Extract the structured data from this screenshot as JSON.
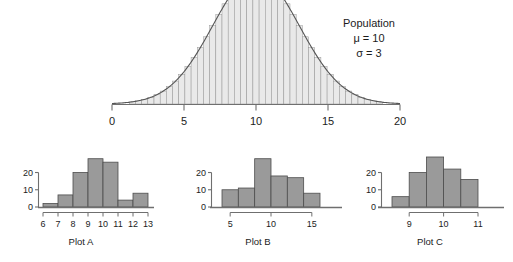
{
  "figure": {
    "background_color": "#ffffff",
    "bar_fill_color": "#9a9a9a",
    "bar_edge_color": "#4d4d4d",
    "curve_fill_color": "#e9e9e9",
    "curve_line_color": "#555555",
    "axis_color": "#6f6f6f",
    "text_color": "#1c1c1c"
  },
  "annotation": {
    "title": "Population",
    "mu": "μ = 10",
    "sigma": "σ = 3"
  },
  "chart_data": [
    {
      "type": "area",
      "name": "population-normal-curve",
      "title": "Population",
      "distribution": "normal",
      "mu": 10,
      "sigma": 3,
      "xlabel": "",
      "ylabel": "",
      "xlim": [
        0,
        20
      ],
      "xticks": [
        0,
        5,
        10,
        15,
        20
      ],
      "xticklabels": [
        "0",
        "5",
        "10",
        "15",
        "20"
      ],
      "grid": false,
      "legend": "none",
      "annotations": [
        "Population",
        "μ = 10",
        "σ = 3"
      ],
      "vertical_strips": true,
      "strip_count": 41,
      "x": [
        0,
        0.5,
        1,
        1.5,
        2,
        2.5,
        3,
        3.5,
        4,
        4.5,
        5,
        5.5,
        6,
        6.5,
        7,
        7.5,
        8,
        8.5,
        9,
        9.5,
        10,
        10.5,
        11,
        11.5,
        12,
        12.5,
        13,
        13.5,
        14,
        14.5,
        15,
        15.5,
        16,
        16.5,
        17,
        17.5,
        18,
        18.5,
        19,
        19.5,
        20
      ],
      "y": [
        0.0005,
        0.0009,
        0.0015,
        0.0024,
        0.0037,
        0.0055,
        0.0081,
        0.0116,
        0.0161,
        0.0218,
        0.0287,
        0.0368,
        0.0458,
        0.0555,
        0.0652,
        0.0743,
        0.0822,
        0.088,
        0.0913,
        0.0925,
        0.0913,
        0.088,
        0.0822,
        0.0743,
        0.0652,
        0.0555,
        0.0458,
        0.0368,
        0.0287,
        0.0218,
        0.0161,
        0.0116,
        0.0081,
        0.0055,
        0.0037,
        0.0024,
        0.0015,
        0.0009,
        0.0005,
        0.0003,
        0.0002
      ]
    },
    {
      "type": "bar",
      "name": "plot-a-histogram",
      "title": "Plot A",
      "xlabel": "Plot A",
      "ylabel": "",
      "bin_width": 1,
      "bin_edges": [
        6,
        7,
        8,
        9,
        10,
        11,
        12,
        13
      ],
      "categories": [
        "6-7",
        "7-8",
        "8-9",
        "9-10",
        "10-11",
        "11-12",
        "12-13"
      ],
      "values": [
        2,
        7,
        20,
        28,
        26,
        4,
        8
      ],
      "xlim": [
        6,
        13
      ],
      "ylim": [
        0,
        29
      ],
      "xticks": [
        6,
        7,
        8,
        9,
        10,
        11,
        12,
        13
      ],
      "xticklabels": [
        "6",
        "7",
        "8",
        "9",
        "10",
        "11",
        "12",
        "13"
      ],
      "yticks": [
        0,
        10,
        20
      ],
      "yticklabels": [
        "0",
        "10",
        "20"
      ],
      "grid": false,
      "legend": "none"
    },
    {
      "type": "bar",
      "name": "plot-b-histogram",
      "title": "Plot B",
      "xlabel": "Plot B",
      "ylabel": "",
      "bin_width": 2,
      "bin_edges": [
        4,
        6,
        8,
        10,
        12,
        14,
        16
      ],
      "categories": [
        "4-6",
        "6-8",
        "8-10",
        "10-12",
        "12-14",
        "14-16"
      ],
      "values": [
        10,
        11,
        28,
        18,
        17,
        8
      ],
      "xlim": [
        4,
        16
      ],
      "ylim": [
        0,
        29
      ],
      "xticks": [
        5,
        10,
        15
      ],
      "xticklabels": [
        "5",
        "10",
        "15"
      ],
      "yticks": [
        0,
        10,
        20
      ],
      "yticklabels": [
        "0",
        "10",
        "20"
      ],
      "grid": false,
      "legend": "none"
    },
    {
      "type": "bar",
      "name": "plot-c-histogram",
      "title": "Plot C",
      "xlabel": "Plot C",
      "ylabel": "",
      "bin_width": 0.5,
      "bin_edges": [
        8.5,
        9.0,
        9.5,
        10.0,
        10.5,
        11.0
      ],
      "categories": [
        "8.5-9.0",
        "9.0-9.5",
        "9.5-10.0",
        "10.0-10.5",
        "10.5-11.0"
      ],
      "values": [
        6,
        20,
        29,
        22,
        16
      ],
      "xlim": [
        8.5,
        11.0
      ],
      "ylim": [
        0,
        29
      ],
      "xticks": [
        9,
        10,
        11
      ],
      "xticklabels": [
        "9",
        "10",
        "11"
      ],
      "yticks": [
        0,
        10,
        20
      ],
      "yticklabels": [
        "0",
        "10",
        "20"
      ],
      "grid": false,
      "legend": "none"
    }
  ]
}
